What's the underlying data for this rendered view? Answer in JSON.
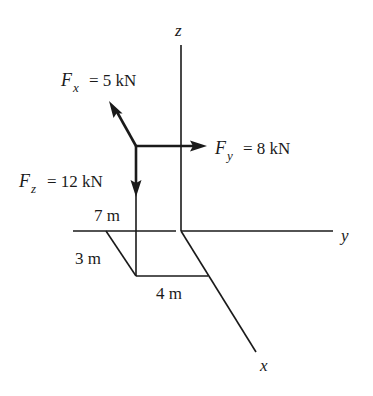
{
  "figure": {
    "type": "3D force diagram",
    "axes": {
      "x": {
        "label": "x"
      },
      "y": {
        "label": "y"
      },
      "z": {
        "label": "z"
      }
    },
    "forces": [
      {
        "name": "Fx",
        "symbol": "F",
        "subscript": "x",
        "equals": "= 5 kN",
        "value": 5,
        "unit": "kN"
      },
      {
        "name": "Fy",
        "symbol": "F",
        "subscript": "y",
        "equals": "= 8 kN",
        "value": 8,
        "unit": "kN"
      },
      {
        "name": "Fz",
        "symbol": "F",
        "subscript": "z",
        "equals": "= 12 kN",
        "value": 12,
        "unit": "kN"
      }
    ],
    "dimensions": [
      {
        "name": "height",
        "label": "7 m",
        "value": 7,
        "unit": "m"
      },
      {
        "name": "x-offset",
        "label": "3 m",
        "value": 3,
        "unit": "m"
      },
      {
        "name": "y-offset",
        "label": "4 m",
        "value": 4,
        "unit": "m"
      }
    ]
  }
}
